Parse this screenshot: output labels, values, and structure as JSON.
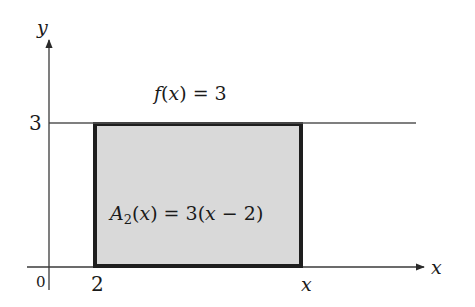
{
  "diagram": {
    "axes": {
      "x_label": "x",
      "y_label": "y",
      "origin_label": "0"
    },
    "ticks": {
      "x_start_label": "2",
      "x_end_label": "x",
      "y_level_label": "3"
    },
    "function_label": {
      "lhs": "f(x) = 3"
    },
    "area_label": {
      "text": "A₂(x) = 3(x − 2)"
    },
    "colors": {
      "rect_fill": "#d9d9d9",
      "rect_border": "#1e1e1e",
      "axis": "#3a3a3a"
    }
  }
}
